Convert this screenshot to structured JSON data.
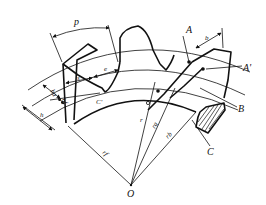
{
  "figure": {
    "type": "spur-gear-geometry-diagram",
    "labels": {
      "pitch": "p",
      "tooth_thickness": "s",
      "space_width": "e",
      "addendum": "ha",
      "dedendum": "hf",
      "tooth_height": "h",
      "face_width": "b",
      "center": "O",
      "radius": "r",
      "tip_radius": "ra",
      "root_radius": "rf",
      "base_radius": "rb",
      "point_A": "A",
      "point_A_prime": "A'",
      "point_B": "B",
      "point_C": "C",
      "point_C_prime": "C'"
    },
    "colors": {
      "line": "#111111",
      "background": "#ffffff"
    }
  }
}
